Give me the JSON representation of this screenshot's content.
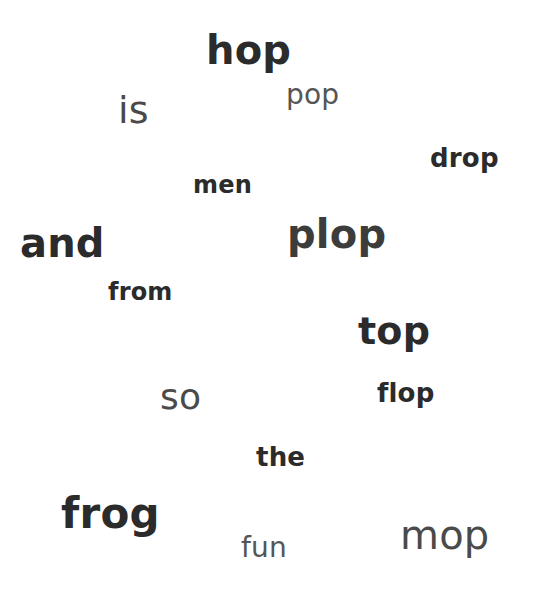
{
  "words": [
    {
      "text": "hop",
      "weight": "bold",
      "size": 40,
      "left": 206,
      "top": 30,
      "color": "#2b2b2b"
    },
    {
      "text": "is",
      "weight": "regular",
      "size": 38,
      "left": 118,
      "top": 91,
      "color": "#4a4a4a"
    },
    {
      "text": "pop",
      "weight": "regular",
      "size": 28,
      "left": 286,
      "top": 81,
      "color": "#555555"
    },
    {
      "text": "drop",
      "weight": "bold",
      "size": 26,
      "left": 430,
      "top": 145,
      "color": "#2b2b2b"
    },
    {
      "text": "men",
      "weight": "bold",
      "size": 24,
      "left": 193,
      "top": 173,
      "color": "#2b2b2b"
    },
    {
      "text": "and",
      "weight": "bold",
      "size": 40,
      "left": 20,
      "top": 223,
      "color": "#2b2b2b"
    },
    {
      "text": "plop",
      "weight": "semi",
      "size": 40,
      "left": 287,
      "top": 214,
      "color": "#3c3c3c"
    },
    {
      "text": "from",
      "weight": "bold",
      "size": 24,
      "left": 108,
      "top": 280,
      "color": "#2b2b2b"
    },
    {
      "text": "top",
      "weight": "bold",
      "size": 38,
      "left": 358,
      "top": 312,
      "color": "#2b2b2b"
    },
    {
      "text": "so",
      "weight": "regular",
      "size": 36,
      "left": 160,
      "top": 379,
      "color": "#4a4a4a"
    },
    {
      "text": "flop",
      "weight": "bold",
      "size": 26,
      "left": 377,
      "top": 380,
      "color": "#2b2b2b"
    },
    {
      "text": "the",
      "weight": "bold",
      "size": 26,
      "left": 256,
      "top": 444,
      "color": "#2b2b2b"
    },
    {
      "text": "frog",
      "weight": "bold",
      "size": 42,
      "left": 61,
      "top": 493,
      "color": "#2b2b2b"
    },
    {
      "text": "fun",
      "weight": "regular",
      "size": 28,
      "left": 241,
      "top": 534,
      "color": "#555555"
    },
    {
      "text": "mop",
      "weight": "regular",
      "size": 40,
      "left": 400,
      "top": 515,
      "color": "#4a4a4a"
    }
  ]
}
